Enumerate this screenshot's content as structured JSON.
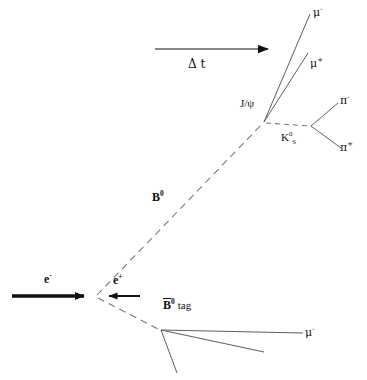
{
  "figure": {
    "background_color": "#ffffff",
    "line_color": "#111111",
    "width": 367,
    "height": 380
  },
  "labels": {
    "mu_minus_top": "μ",
    "mu_minus_top_charge": "-",
    "mu_plus_top": "μ",
    "mu_plus_top_charge": "+",
    "jpsi": "J/ψ",
    "ks": "K",
    "ks_sub": "S",
    "ks_sup": "0",
    "pi_minus": "π",
    "pi_minus_charge": "-",
    "pi_plus": "π",
    "pi_plus_charge": "+",
    "delta_t": "Δ t",
    "b_zero": "B",
    "b_zero_sup": "0",
    "e_minus": "e",
    "e_minus_charge": "-",
    "e_plus": "e",
    "e_plus_charge": "+",
    "bbar_tag_symbol": "B",
    "bbar_tag_sup": "0",
    "bbar_tag_word": "tag",
    "mu_minus_bottom": "μ",
    "mu_minus_bottom_charge": "-"
  },
  "elements": {
    "time_arrow": {
      "name": "delta-t-arrow",
      "x1": 155,
      "y1": 49,
      "x2": 272,
      "y2": 49
    },
    "electron_beam": {
      "name": "electron-beam-arrow",
      "x1": 12,
      "y1": 296,
      "x2": 92,
      "y2": 296
    },
    "positron_beam": {
      "name": "positron-beam-arrow",
      "x1": 140,
      "y1": 296,
      "x2": 101,
      "y2": 296
    },
    "b_zero_track": {
      "name": "b-zero-flight-path",
      "x1": 97,
      "y1": 295,
      "x2": 264,
      "y2": 122,
      "style": "dashed"
    },
    "bbar_tag_track": {
      "name": "bbar-tag-flight-path",
      "x1": 97,
      "y1": 298,
      "x2": 161,
      "y2": 330,
      "style": "dashed"
    },
    "ks_track": {
      "name": "ks-flight-path",
      "x1": 265,
      "y1": 123,
      "x2": 311,
      "y2": 126,
      "style": "dashed"
    },
    "mu_minus_track": {
      "name": "mu-minus-track-upper",
      "x1": 264,
      "y1": 122,
      "x2": 310,
      "y2": 14,
      "style": "solid"
    },
    "mu_plus_track": {
      "name": "mu-plus-track-upper",
      "x1": 264,
      "y1": 122,
      "x2": 308,
      "y2": 53,
      "style": "solid"
    },
    "pi_minus_track": {
      "name": "pi-minus-track",
      "x1": 311,
      "y1": 126,
      "x2": 338,
      "y2": 103,
      "style": "solid"
    },
    "pi_plus_track": {
      "name": "pi-plus-track",
      "x1": 311,
      "y1": 126,
      "x2": 341,
      "y2": 148,
      "style": "solid"
    },
    "tag_track_1": {
      "name": "tag-track-mu-minus",
      "x1": 161,
      "y1": 330,
      "x2": 303,
      "y2": 333,
      "style": "solid"
    },
    "tag_track_2": {
      "name": "tag-track-middle",
      "x1": 161,
      "y1": 330,
      "x2": 264,
      "y2": 352,
      "style": "solid"
    },
    "tag_track_3": {
      "name": "tag-track-lower",
      "x1": 161,
      "y1": 330,
      "x2": 177,
      "y2": 373,
      "style": "solid"
    }
  },
  "vertices": {
    "interaction_point": {
      "name": "e-plus-e-minus-interaction-point",
      "x": 97,
      "y": 296
    },
    "b_decay_vertex": {
      "name": "b-zero-decay-vertex",
      "x": 264,
      "y": 122
    },
    "ks_decay_vertex": {
      "name": "ks-decay-vertex",
      "x": 311,
      "y": 126
    },
    "tag_vertex": {
      "name": "bbar-tag-decay-vertex",
      "x": 161,
      "y": 330
    }
  }
}
